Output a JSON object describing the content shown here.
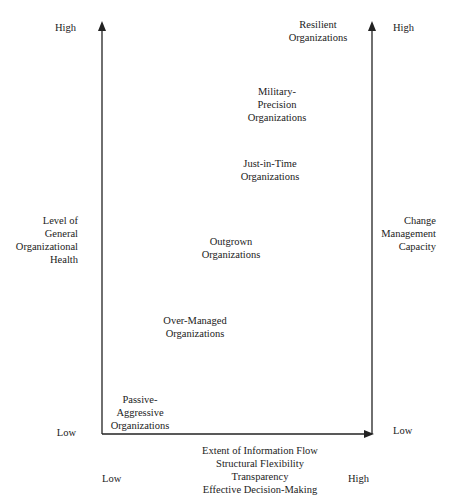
{
  "left_axis": {
    "high": "High",
    "low": "Low",
    "title": "Level of\nGeneral\nOrganizational\nHealth"
  },
  "right_axis": {
    "high": "High",
    "low": "Low",
    "title": "Change\nManagement\nCapacity"
  },
  "bottom_axis": {
    "low": "Low",
    "high": "High",
    "title": "Extent of Information Flow\nStructural Flexibility\nTransparency\nEffective Decision-Making"
  },
  "organizations": [
    {
      "label": "Resilient\nOrganizations"
    },
    {
      "label": "Military-\nPrecision\nOrganizations"
    },
    {
      "label": "Just-in-Time\nOrganizations"
    },
    {
      "label": "Outgrown\nOrganizations"
    },
    {
      "label": "Over-Managed\nOrganizations"
    },
    {
      "label": "Passive-\nAggressive\nOrganizations"
    }
  ],
  "colors": {
    "line": "#222222",
    "text": "#222222"
  }
}
